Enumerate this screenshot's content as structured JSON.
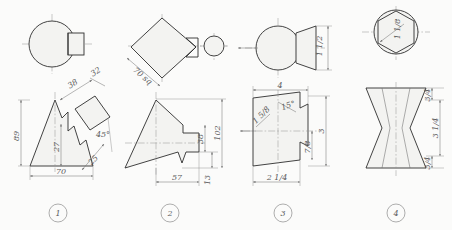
{
  "sheet": {
    "title": "Orthographic projection exercise sheet",
    "background_color": "#fbfbfa",
    "line_color": "#3a3a3a",
    "dimension_color": "#6f6f6f"
  },
  "figures": [
    {
      "number": "1",
      "top_view": {
        "shape": "circle-with-rectangle",
        "description": "circle with small rectangle tangent at right"
      },
      "front_view": {
        "shape": "triangle-with-stepped-profile",
        "description": "tall triangle with stepped notch and rotated square at 45 degrees"
      },
      "dimensions": [
        {
          "label": "89",
          "orientation": "vertical",
          "position": "left"
        },
        {
          "label": "70",
          "orientation": "horizontal",
          "position": "bottom"
        },
        {
          "label": "27",
          "orientation": "vertical",
          "position": "center"
        },
        {
          "label": "38",
          "orientation": "diagonal",
          "position": "upper-right"
        },
        {
          "label": "32",
          "orientation": "diagonal",
          "position": "top-right"
        },
        {
          "label": "25",
          "orientation": "diagonal",
          "position": "lower-right"
        },
        {
          "label": "45°",
          "orientation": "horizontal",
          "position": "right"
        }
      ]
    },
    {
      "number": "2",
      "top_view": {
        "shape": "diamond-with-circle",
        "description": "square rotated 45 degrees with small circle at right"
      },
      "front_view": {
        "shape": "triangle-with-stepped-block",
        "description": "triangle with stepped rectangular block to the right"
      },
      "dimensions": [
        {
          "label": "70 sq",
          "orientation": "diagonal",
          "position": "lower-left"
        },
        {
          "label": "57",
          "orientation": "horizontal",
          "position": "bottom"
        },
        {
          "label": "13",
          "orientation": "vertical",
          "position": "bottom-right"
        },
        {
          "label": "102",
          "orientation": "vertical",
          "position": "right"
        },
        {
          "label": "38",
          "orientation": "vertical",
          "position": "inner-right"
        }
      ]
    },
    {
      "number": "3",
      "top_view": {
        "shape": "circle-with-tapered-boss",
        "description": "circle with tapered trapezoidal boss at right, view arrow at left"
      },
      "front_view": {
        "shape": "tapered-block-with-notch",
        "description": "tapered block with stepped notch on right side"
      },
      "dimensions": [
        {
          "label": "4",
          "orientation": "horizontal",
          "position": "top"
        },
        {
          "label": "15°",
          "orientation": "diagonal",
          "position": "upper-center"
        },
        {
          "label": "1 5/8",
          "orientation": "diagonal",
          "position": "left"
        },
        {
          "label": "2 1/4",
          "orientation": "diagonal",
          "position": "bottom"
        },
        {
          "label": "3",
          "orientation": "vertical",
          "position": "right"
        },
        {
          "label": "7/8",
          "orientation": "vertical",
          "position": "inner-right"
        },
        {
          "label": "1 1/2",
          "orientation": "vertical",
          "position": "top-right"
        }
      ]
    },
    {
      "number": "4",
      "top_view": {
        "shape": "hexagon-in-circle",
        "description": "regular hexagon inscribed in a circle with radius leader"
      },
      "front_view": {
        "shape": "hourglass-double-taper",
        "description": "double tapered hourglass profile"
      },
      "dimensions": [
        {
          "label": "1 1/8",
          "orientation": "diagonal",
          "position": "hexagon-leader"
        },
        {
          "label": "3/4",
          "orientation": "vertical",
          "position": "top-right"
        },
        {
          "label": "3 1/4",
          "orientation": "vertical",
          "position": "right"
        },
        {
          "label": "3/4",
          "orientation": "vertical",
          "position": "bottom-right"
        }
      ]
    }
  ],
  "figure_labels": [
    "1",
    "2",
    "3",
    "4"
  ]
}
